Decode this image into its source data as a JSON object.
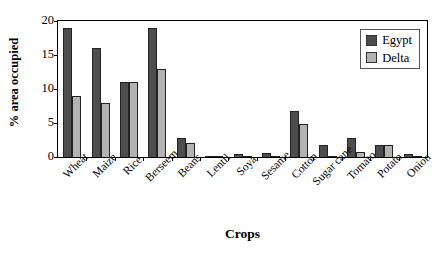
{
  "chart_data": {
    "type": "bar",
    "title": "",
    "xlabel": "Crops",
    "ylabel": "% area occupied",
    "ylim": [
      0,
      20
    ],
    "yticks": [
      0,
      5,
      10,
      15,
      20
    ],
    "grid": false,
    "legend_position": "top-right",
    "categories": [
      "Wheat",
      "Maize",
      "Rice",
      "Berseem",
      "Beans",
      "Lentil",
      "Soya",
      "Sesame",
      "Cotton",
      "Sugar cane",
      "Tomato",
      "Potato",
      "Onion"
    ],
    "series": [
      {
        "name": "Egypt",
        "color": "#4d4d4d",
        "values": [
          19.0,
          16.0,
          11.0,
          18.9,
          2.8,
          0.2,
          0.4,
          0.6,
          6.7,
          1.8,
          2.8,
          1.7,
          0.5
        ]
      },
      {
        "name": "Delta",
        "color": "#b3b3b3",
        "values": [
          9.0,
          8.0,
          11.0,
          13.0,
          2.0,
          0.05,
          0.08,
          0.1,
          4.8,
          0.1,
          0.8,
          1.7,
          0.07
        ]
      }
    ]
  },
  "legend": {
    "items": [
      {
        "label": "Egypt",
        "swatch": "egypt"
      },
      {
        "label": "Delta",
        "swatch": "delta"
      }
    ]
  }
}
